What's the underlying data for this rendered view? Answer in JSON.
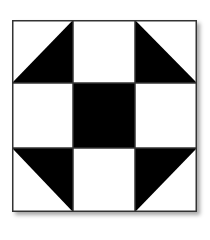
{
  "diagram": {
    "name": "Shoo-fly quilt block",
    "grid": {
      "rows": 3,
      "cols": 3
    },
    "colors": {
      "dark": "#000000",
      "light": "#ffffff",
      "line": "#333333"
    },
    "cells": [
      {
        "row": 0,
        "col": 0,
        "type": "half-square-triangle",
        "dark_corner": "bottom-right"
      },
      {
        "row": 0,
        "col": 1,
        "type": "solid",
        "fill": "light"
      },
      {
        "row": 0,
        "col": 2,
        "type": "half-square-triangle",
        "dark_corner": "bottom-left"
      },
      {
        "row": 1,
        "col": 0,
        "type": "solid",
        "fill": "light"
      },
      {
        "row": 1,
        "col": 1,
        "type": "solid",
        "fill": "dark"
      },
      {
        "row": 1,
        "col": 2,
        "type": "solid",
        "fill": "light"
      },
      {
        "row": 2,
        "col": 0,
        "type": "half-square-triangle",
        "dark_corner": "top-right"
      },
      {
        "row": 2,
        "col": 1,
        "type": "solid",
        "fill": "light"
      },
      {
        "row": 2,
        "col": 2,
        "type": "half-square-triangle",
        "dark_corner": "top-left"
      }
    ]
  }
}
